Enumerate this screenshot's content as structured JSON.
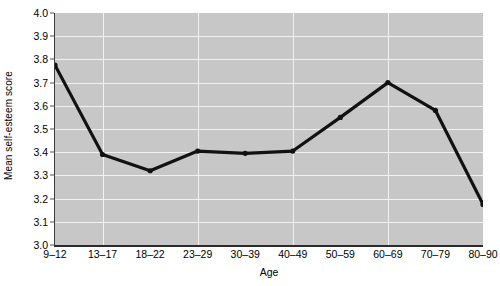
{
  "chart_data": {
    "type": "line",
    "title": "",
    "xlabel": "Age",
    "ylabel": "Mean self-esteem score",
    "categories": [
      "9–12",
      "13–17",
      "18–22",
      "23–29",
      "30–39",
      "40–49",
      "50–59",
      "60–69",
      "70–79",
      "80–90"
    ],
    "values": [
      3.775,
      3.39,
      3.32,
      3.405,
      3.395,
      3.405,
      3.55,
      3.7,
      3.58,
      3.175
    ],
    "series": [
      {
        "name": "Mean self-esteem score",
        "values": [
          3.775,
          3.39,
          3.32,
          3.405,
          3.395,
          3.405,
          3.55,
          3.7,
          3.58,
          3.175
        ]
      }
    ],
    "ylim": [
      3.0,
      4.0
    ],
    "ytick_labels": [
      "3.0",
      "3.1",
      "3.2",
      "3.3",
      "3.4",
      "3.5",
      "3.6",
      "3.7",
      "3.8",
      "3.9",
      "4.0"
    ],
    "ytick_values": [
      3.0,
      3.1,
      3.2,
      3.3,
      3.4,
      3.5,
      3.6,
      3.7,
      3.8,
      3.9,
      4.0
    ],
    "grid": true,
    "grid_color": "#f2f2f2",
    "vertical_gridline_categories": [
      "13–17",
      "23–29",
      "40–49",
      "60–69",
      "80–90"
    ],
    "legend": "none",
    "plot_background": "#c7c7c7",
    "line_color": "#111111",
    "marker": "circle",
    "marker_color": "#111111"
  }
}
